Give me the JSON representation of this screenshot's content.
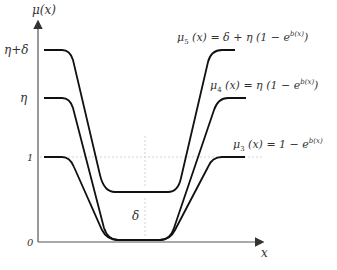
{
  "diagram": {
    "y_axis_label": "μ(x)",
    "x_axis_label": "x",
    "y_ticks": [
      {
        "id": "eta_delta",
        "label": "η+δ"
      },
      {
        "id": "eta",
        "label": "η"
      },
      {
        "id": "one",
        "label": "1"
      },
      {
        "id": "zero",
        "label": "0"
      }
    ],
    "gap_label": "δ",
    "curves": [
      {
        "id": "mu5",
        "name": "μ5",
        "equation_prefix": "μ",
        "sub": "5",
        "equation_body": " (x) = δ + η (1 − e",
        "sup": "b(x)",
        "equation_suffix": ")"
      },
      {
        "id": "mu4",
        "name": "μ4",
        "equation_prefix": "μ",
        "sub": "4",
        "equation_body": " (x) = η (1 − e",
        "sup": "b(x)",
        "equation_suffix": ")"
      },
      {
        "id": "mu3",
        "name": "μ3",
        "equation_prefix": "μ",
        "sub": "3",
        "equation_body": " (x) = 1 − e",
        "sup": "b(x)",
        "equation_suffix": ""
      }
    ],
    "colors": {
      "curve": "#111111",
      "axis": "#555555",
      "guide": "#bbbbbb",
      "text": "#333333"
    }
  }
}
